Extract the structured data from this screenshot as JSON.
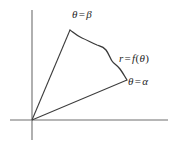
{
  "figure": {
    "kind": "polar-region-diagram",
    "background_color": "#ffffff",
    "axis_color": "#6e6e6e",
    "line_color": "#3c3c3c",
    "curve_color": "#3a3a3a",
    "label_color": "#262626",
    "origin": {
      "x": 32,
      "y": 120
    },
    "axes": {
      "x_axis": {
        "x1": 10,
        "y1": 120,
        "x2": 168,
        "y2": 120
      },
      "y_axis": {
        "x1": 32,
        "y1": 10,
        "x2": 32,
        "y2": 140
      }
    },
    "rays": [
      {
        "name": "ray-beta",
        "from_x": 32,
        "from_y": 120,
        "to_x": 70,
        "to_y": 30
      },
      {
        "name": "ray-alpha",
        "from_x": 32,
        "from_y": 120,
        "to_x": 127,
        "to_y": 80
      }
    ],
    "curve": {
      "name": "r-equals-f-theta-curve",
      "start": {
        "x": 70,
        "y": 30
      },
      "end": {
        "x": 127,
        "y": 80
      },
      "path": "M 70 30 C 74 33, 77 36, 82 38 C 87 40, 92 43, 97 45 C 100 46, 103 46, 106 50 C 109 54, 110 58, 112 61 C 114 64, 117 65, 120 69 C 123 73, 125 77, 127 80"
    },
    "labels": {
      "beta": {
        "lhs": "θ",
        "eq": "=",
        "rhs": "β",
        "text": "θ = β"
      },
      "alpha": {
        "lhs": "θ",
        "eq": "=",
        "rhs": "α",
        "text": "θ = α"
      },
      "function": {
        "lhs": "r",
        "eq": "=",
        "fn": "f",
        "open": "(",
        "arg": "θ",
        "close": ")",
        "text": "r = f(θ)"
      }
    }
  }
}
